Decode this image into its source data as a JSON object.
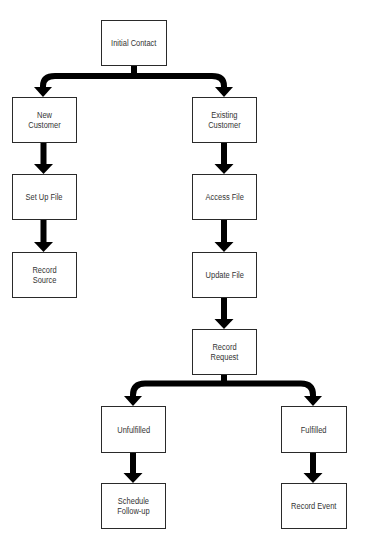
{
  "diagram": {
    "type": "flowchart",
    "colors": {
      "background": "#ffffff",
      "box_border": "#2a2a2a",
      "arrow": "#000000",
      "text": "#333333"
    },
    "nodes": [
      {
        "id": "initial-contact",
        "label": "Initial Contact",
        "x": 101,
        "y": 20,
        "w": 66,
        "h": 46
      },
      {
        "id": "new-customer",
        "label": "New Customer",
        "x": 12,
        "y": 97,
        "w": 65,
        "h": 46
      },
      {
        "id": "existing-customer",
        "label": "Existing\nCustomer",
        "x": 192,
        "y": 97,
        "w": 65,
        "h": 46
      },
      {
        "id": "set-up-file",
        "label": "Set Up File",
        "x": 12,
        "y": 174,
        "w": 65,
        "h": 46
      },
      {
        "id": "access-file",
        "label": "Access File",
        "x": 192,
        "y": 174,
        "w": 65,
        "h": 46
      },
      {
        "id": "record-source",
        "label": "Record Source",
        "x": 12,
        "y": 252,
        "w": 65,
        "h": 46
      },
      {
        "id": "update-file",
        "label": "Update File",
        "x": 192,
        "y": 252,
        "w": 65,
        "h": 46
      },
      {
        "id": "record-request",
        "label": "Record Request",
        "x": 192,
        "y": 329,
        "w": 65,
        "h": 46
      },
      {
        "id": "unfulfilled",
        "label": "Unfulfilled",
        "x": 101,
        "y": 406,
        "w": 65,
        "h": 47
      },
      {
        "id": "fulfilled",
        "label": "Fulfilled",
        "x": 281,
        "y": 406,
        "w": 66,
        "h": 47
      },
      {
        "id": "schedule-follow-up",
        "label": "Schedule\nFollow-up",
        "x": 101,
        "y": 483,
        "w": 65,
        "h": 46
      },
      {
        "id": "record-event",
        "label": "Record Event",
        "x": 281,
        "y": 483,
        "w": 66,
        "h": 46
      }
    ],
    "edges": [
      {
        "from": "initial-contact",
        "to": "new-customer",
        "style": "branch"
      },
      {
        "from": "initial-contact",
        "to": "existing-customer",
        "style": "branch"
      },
      {
        "from": "new-customer",
        "to": "set-up-file",
        "style": "straight"
      },
      {
        "from": "set-up-file",
        "to": "record-source",
        "style": "straight"
      },
      {
        "from": "existing-customer",
        "to": "access-file",
        "style": "straight"
      },
      {
        "from": "access-file",
        "to": "update-file",
        "style": "straight"
      },
      {
        "from": "update-file",
        "to": "record-request",
        "style": "straight"
      },
      {
        "from": "record-request",
        "to": "unfulfilled",
        "style": "branch"
      },
      {
        "from": "record-request",
        "to": "fulfilled",
        "style": "branch"
      },
      {
        "from": "unfulfilled",
        "to": "schedule-follow-up",
        "style": "straight"
      },
      {
        "from": "fulfilled",
        "to": "record-event",
        "style": "straight"
      }
    ]
  }
}
